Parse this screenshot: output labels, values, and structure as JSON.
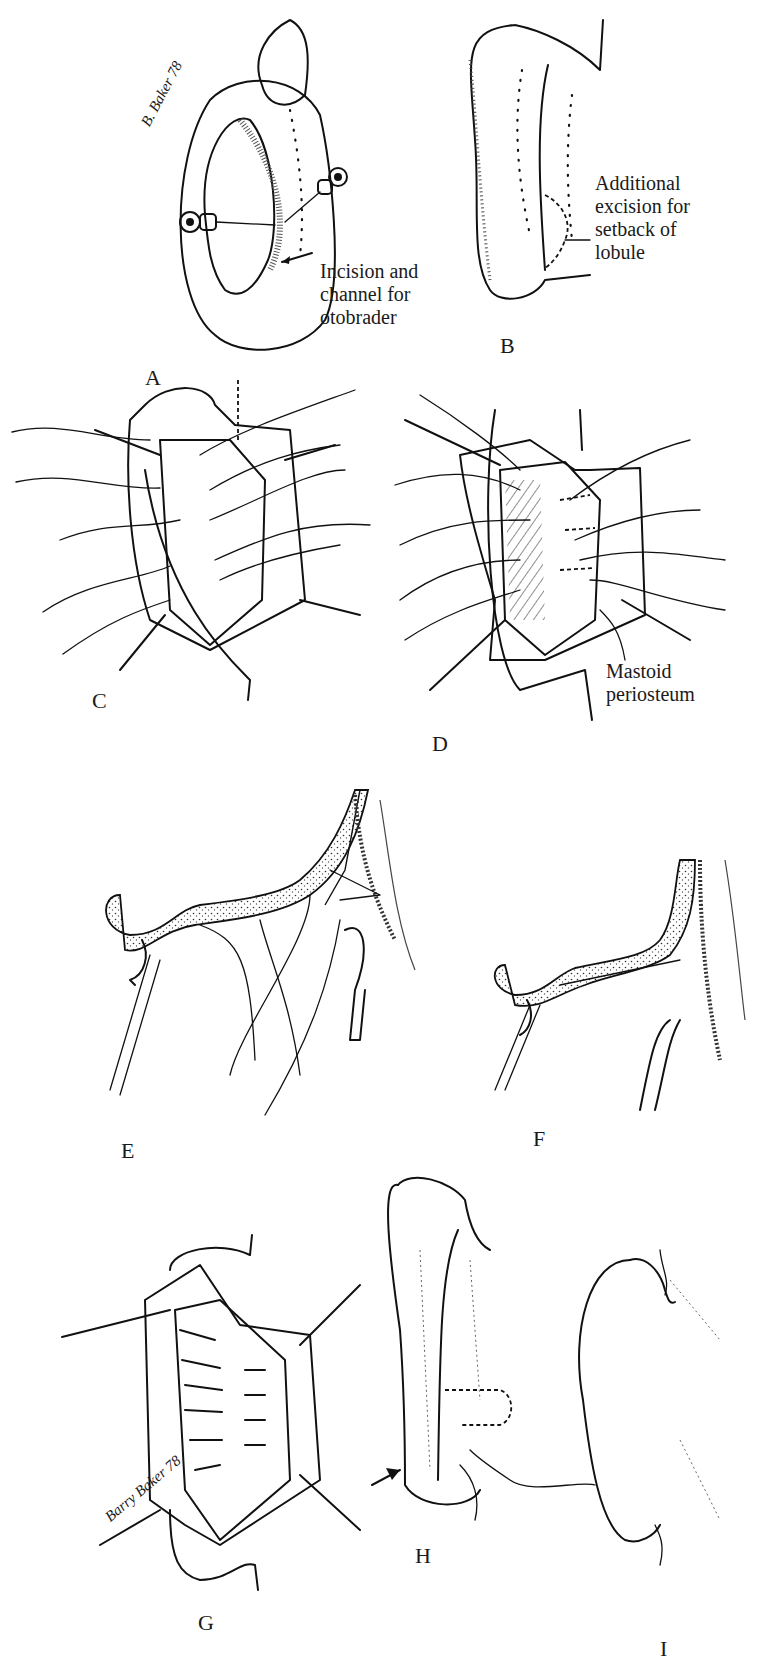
{
  "figure": {
    "panels": [
      {
        "id": "A",
        "label": "A",
        "callout": [
          "Incision and",
          "channel for",
          "otobrader"
        ],
        "signature": "B. Baker 78"
      },
      {
        "id": "B",
        "label": "B",
        "callout": [
          "Additional",
          "excision for",
          "setback of",
          "lobule"
        ]
      },
      {
        "id": "C",
        "label": "C"
      },
      {
        "id": "D",
        "label": "D",
        "callout": [
          "Mastoid",
          "periosteum"
        ]
      },
      {
        "id": "E",
        "label": "E"
      },
      {
        "id": "F",
        "label": "F"
      },
      {
        "id": "G",
        "label": "G",
        "signature": "Barry Baker 78"
      },
      {
        "id": "H",
        "label": "H"
      },
      {
        "id": "I",
        "label": "I"
      }
    ]
  }
}
